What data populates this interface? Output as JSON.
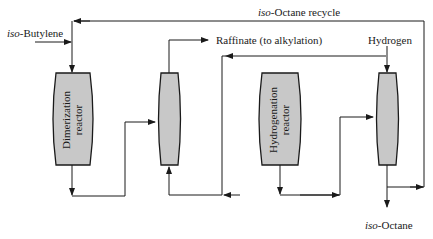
{
  "diagram": {
    "streams": {
      "feed": {
        "prefix": "iso",
        "suffix": "-Butylene"
      },
      "recycle": {
        "prefix": "iso",
        "suffix": "-Octane recycle"
      },
      "raffinate": "Raffinate (to alkylation)",
      "hydrogen": "Hydrogen",
      "product": {
        "prefix": "iso",
        "suffix": "-Octane"
      }
    },
    "units": {
      "dimerization_reactor": {
        "line1": "Dimerization",
        "line2": "reactor"
      },
      "separator_1": {
        "label": ""
      },
      "hydrogenation_reactor": {
        "line1": "Hydrogenation",
        "line2": "reactor"
      },
      "separator_2": {
        "label": ""
      }
    },
    "colors": {
      "vessel_fill": "#c8c8c8",
      "line": "#1a1a1a"
    }
  }
}
